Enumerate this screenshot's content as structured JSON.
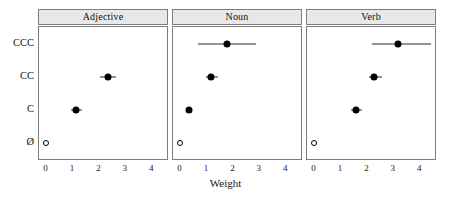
{
  "chart_data": {
    "type": "scatter",
    "title": "",
    "xlabel": "Weight",
    "ylabel": "",
    "xlim": [
      -0.25,
      4.6
    ],
    "xticks": [
      0,
      1,
      2,
      3,
      4
    ],
    "xticklabels": [
      "0",
      "1",
      "2",
      "3",
      "4"
    ],
    "categories": [
      "CCC",
      "CC",
      "C",
      "Ø"
    ],
    "grid": false,
    "legend": false,
    "panel_layout": "1x3 horizontal facets with gray strip headers",
    "reference_level": "Ø",
    "panels": [
      {
        "label": "Adjective",
        "points": [
          {
            "category": "CCC",
            "value": null,
            "low": null,
            "high": null,
            "marker": "none"
          },
          {
            "category": "CC",
            "value": 2.35,
            "low": 2.05,
            "high": 2.68,
            "marker": "filled"
          },
          {
            "category": "C",
            "value": 1.15,
            "low": 0.95,
            "high": 1.38,
            "marker": "filled"
          },
          {
            "category": "Ø",
            "value": 0,
            "low": 0,
            "high": 0,
            "marker": "open"
          }
        ]
      },
      {
        "label": "Noun",
        "points": [
          {
            "category": "CCC",
            "value": 1.8,
            "low": 0.7,
            "high": 2.9,
            "marker": "filled"
          },
          {
            "category": "CC",
            "value": 1.2,
            "low": 1.0,
            "high": 1.45,
            "marker": "filled"
          },
          {
            "category": "C",
            "value": 0.35,
            "low": 0.3,
            "high": 0.42,
            "marker": "filled"
          },
          {
            "category": "Ø",
            "value": 0,
            "low": 0,
            "high": 0,
            "marker": "open"
          }
        ]
      },
      {
        "label": "Verb",
        "points": [
          {
            "category": "CCC",
            "value": 3.2,
            "low": 2.2,
            "high": 4.45,
            "marker": "filled"
          },
          {
            "category": "CC",
            "value": 2.3,
            "low": 2.1,
            "high": 2.6,
            "marker": "filled"
          },
          {
            "category": "C",
            "value": 1.6,
            "low": 1.4,
            "high": 1.82,
            "marker": "filled"
          },
          {
            "category": "Ø",
            "value": 0,
            "low": 0,
            "high": 0,
            "marker": "open"
          }
        ]
      }
    ]
  },
  "colors": {
    "point": "#000000",
    "strip_background": "#e8e8e8",
    "border": "#7d7d7d",
    "text": "#161616",
    "plot_background": "#ffffff"
  }
}
